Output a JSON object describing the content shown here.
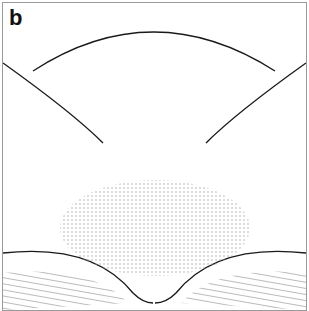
{
  "figure": {
    "panel_label": "b"
  },
  "colors": {
    "line": "#1a1a1a",
    "border": "#9a9a9a",
    "stipple": "#bdbdbd",
    "background": "#ffffff"
  }
}
